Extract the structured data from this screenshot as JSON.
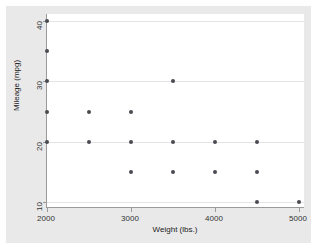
{
  "chart_data": {
    "type": "scatter",
    "title": "",
    "xlabel": "Weight (lbs.)",
    "ylabel": "Mileage (mpg)",
    "xlim": [
      1800,
      5100
    ],
    "ylim": [
      8.5,
      41
    ],
    "xticks": [
      2000,
      3000,
      4000,
      5000
    ],
    "yticks": [
      10,
      20,
      30,
      40
    ],
    "xtick_labels": [
      "2000",
      "3000",
      "4000",
      "5000"
    ],
    "ytick_labels": [
      "10",
      "20",
      "30",
      "40"
    ],
    "grid": "horizontal",
    "gridlines_y": [
      10,
      20,
      30,
      40
    ],
    "legend": null,
    "marker": {
      "shape": "circle",
      "color": "#4a4a52",
      "size": 4
    },
    "points": [
      {
        "x": 2000,
        "y": 40
      },
      {
        "x": 2000,
        "y": 35
      },
      {
        "x": 2000,
        "y": 30
      },
      {
        "x": 2000,
        "y": 25
      },
      {
        "x": 2000,
        "y": 20
      },
      {
        "x": 2500,
        "y": 25
      },
      {
        "x": 2500,
        "y": 20
      },
      {
        "x": 3000,
        "y": 25
      },
      {
        "x": 3000,
        "y": 20
      },
      {
        "x": 3000,
        "y": 15
      },
      {
        "x": 3500,
        "y": 30
      },
      {
        "x": 3500,
        "y": 20
      },
      {
        "x": 3500,
        "y": 15
      },
      {
        "x": 4000,
        "y": 20
      },
      {
        "x": 4000,
        "y": 15
      },
      {
        "x": 4500,
        "y": 20
      },
      {
        "x": 4500,
        "y": 15
      },
      {
        "x": 4500,
        "y": 10
      },
      {
        "x": 5000,
        "y": 10
      }
    ]
  },
  "colors": {
    "figure_background": "#e9e9e9",
    "plot_background": "#ffffff",
    "axis": "#9a9a9a",
    "gridline": "#e4e4e6",
    "marker": "#4a4a52",
    "text": "#222222"
  }
}
